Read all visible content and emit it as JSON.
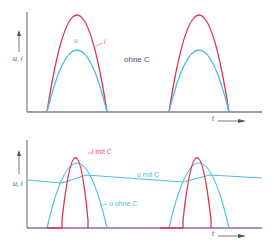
{
  "colors": {
    "current": "#d8384e",
    "voltage": "#4cbfe0",
    "axis": "#555555",
    "baseline": "#8b6fa8"
  },
  "top_plot": {
    "y_axis_label": "u, i",
    "x_axis_label": "t",
    "curve_labels": {
      "voltage": "u",
      "current": "i"
    },
    "annotation": "ohne C"
  },
  "bottom_plot": {
    "y_axis_label": "u, i",
    "x_axis_label": "t",
    "curve_labels": {
      "current_with_c": "i mit C",
      "voltage_with_c": "u mit C",
      "voltage_without_c": "u ohne C"
    }
  }
}
